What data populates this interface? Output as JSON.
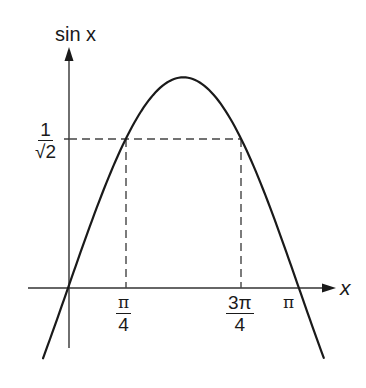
{
  "chart_data": {
    "type": "line",
    "title": "",
    "function": "sin x",
    "xlabel": "x",
    "ylabel": "sin x",
    "x_range": [
      -0.55,
      3.5
    ],
    "y_range": [
      -0.34,
      1.0
    ],
    "x_ticks": [
      {
        "value": 0.7854,
        "label_num": "π",
        "label_den": "4"
      },
      {
        "value": 2.3562,
        "label_num": "3π",
        "label_den": "4"
      },
      {
        "value": 3.1416,
        "label": "π"
      }
    ],
    "y_ticks": [
      {
        "value": 0.7071,
        "label_num": "1",
        "label_den": "√2"
      }
    ],
    "series": [
      {
        "name": "sin x",
        "x": [
          -0.34,
          0,
          0.3927,
          0.7854,
          1.1781,
          1.5708,
          1.9635,
          2.3562,
          2.7489,
          3.1416,
          3.48
        ],
        "y": [
          -0.33,
          0,
          0.3827,
          0.7071,
          0.9239,
          1.0,
          0.9239,
          0.7071,
          0.3827,
          0,
          -0.33
        ]
      }
    ],
    "guides": [
      {
        "type": "dashed-horizontal",
        "y": 0.7071,
        "from_x": 0,
        "to_x": 2.3562
      },
      {
        "type": "dashed-vertical",
        "x": 0.7854,
        "from_y": 0,
        "to_y": 0.7071
      },
      {
        "type": "dashed-vertical",
        "x": 2.3562,
        "from_y": 0,
        "to_y": 0.7071
      }
    ],
    "grid": false,
    "legend": null
  },
  "labels": {
    "y_axis": "sin x",
    "x_axis": "x",
    "y_tick_num": "1",
    "y_tick_den": "√2",
    "x_tick1_num": "π",
    "x_tick1_den": "4",
    "x_tick2_num": "3π",
    "x_tick2_den": "4",
    "x_tick3": "π"
  },
  "colors": {
    "curve": "#1a1a1a",
    "axis": "#333333",
    "dash": "#444444"
  }
}
